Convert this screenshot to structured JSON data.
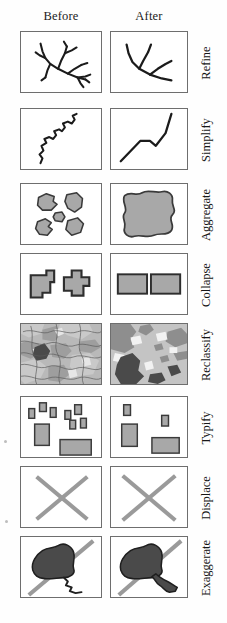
{
  "figure": {
    "column_headers": [
      "Before",
      "After"
    ],
    "row_labels": [
      "Refine",
      "Simplify",
      "Aggregate",
      "Collapse",
      "Reclassify",
      "Typify",
      "Displace",
      "Exaggerate"
    ],
    "colors": {
      "border": "#6e6e6e",
      "ink": "#1b1b1b",
      "fill_light": "#a8a8a8",
      "fill_dark": "#4a4a4a",
      "stroke_gray": "#9a9a9a",
      "background": "#ffffff"
    },
    "rows": [
      {
        "label": "Refine",
        "before_desc": "dense branching stream network",
        "after_desc": "reduced stream network with fewer branches"
      },
      {
        "label": "Simplify",
        "before_desc": "highly sinuous line",
        "after_desc": "smoothed line with few vertices"
      },
      {
        "label": "Aggregate",
        "before_desc": "five separate small polygons",
        "after_desc": "one merged large polygon"
      },
      {
        "label": "Collapse",
        "before_desc": "two detailed building footprints",
        "after_desc": "two simplified rectangles"
      },
      {
        "label": "Reclassify",
        "before_desc": "many fine land cover classes",
        "after_desc": "fewer generalized land cover classes"
      },
      {
        "label": "Typify",
        "before_desc": "many buildings of varying sizes",
        "after_desc": "representative subset of buildings"
      },
      {
        "label": "Displace",
        "before_desc": "two crossing linear features touching",
        "after_desc": "two crossing linear features separated"
      },
      {
        "label": "Exaggerate",
        "before_desc": "lake with thin outlet stream near road",
        "after_desc": "lake with widened outlet stream"
      }
    ]
  }
}
